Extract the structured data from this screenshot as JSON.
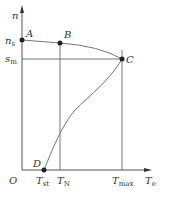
{
  "diagram": {
    "axes": {
      "y_label": "n",
      "x_label": "T",
      "x_label_sub": "e",
      "origin": "O"
    },
    "y_ticks": [
      {
        "main": "n",
        "sub": "s"
      },
      {
        "main": "s",
        "sub": "m"
      }
    ],
    "x_ticks": [
      {
        "main": "T",
        "sub": "st"
      },
      {
        "main": "T",
        "sub": "N"
      },
      {
        "main": "T",
        "sub": "max"
      }
    ],
    "points": [
      {
        "label": "A"
      },
      {
        "label": "B"
      },
      {
        "label": "C"
      },
      {
        "label": "D"
      }
    ],
    "colors": {
      "line": "#555555",
      "curve": "#777777",
      "point": "#222222"
    }
  }
}
